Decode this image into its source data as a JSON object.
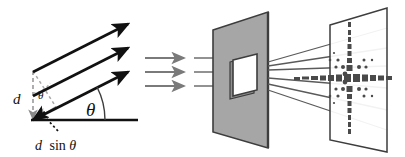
{
  "figure": {
    "background_color": "#ffffff"
  },
  "labels": {
    "d": "d",
    "theta_large": "θ",
    "theta_small": "θ",
    "path_difference": "d sinθ",
    "path_difference_parts": {
      "d": "d",
      "sin": "sin",
      "theta": "θ"
    }
  },
  "colors": {
    "ray_black": "#111111",
    "ray_gray": "#7a7a7a",
    "plate_fill": "#a6a6a6",
    "plate_stroke": "#3d3d3d",
    "aperture_fill": "#ffffff",
    "aperture_stroke": "#3d3d3d",
    "screen_fill": "#ffffff",
    "screen_stroke": "#3d3d3d",
    "pattern_dot": "#4a4a4a",
    "dashed_gray": "#9a9a9a",
    "baseline": "#111111"
  },
  "left_panel": {
    "name": "path-difference-construction",
    "outgoing_rays": [
      {
        "id": "ray-top",
        "x1": 33,
        "y1": 72,
        "x2": 131,
        "y2": 22
      },
      {
        "id": "ray-middle",
        "x1": 33,
        "y1": 96,
        "x2": 131,
        "y2": 46
      },
      {
        "id": "ray-bottom",
        "x1": 33,
        "y1": 120,
        "x2": 131,
        "y2": 70
      }
    ],
    "baseline": {
      "x1": 32,
      "y1": 120,
      "x2": 138,
      "y2": 120
    },
    "spacing_line": {
      "x1": 33,
      "y1": 72,
      "x2": 33,
      "y2": 120,
      "style": "dashed"
    },
    "perpendicular_line": {
      "x1": 33,
      "y1": 72,
      "x2": 55,
      "y2": 106,
      "style": "dashed"
    },
    "path_difference_arrow": {
      "x1": 55,
      "y1": 106,
      "x2": 33,
      "y2": 120
    },
    "angle_arc_large": {
      "cx": 33,
      "cy": 120,
      "r": 72,
      "from_deg": 0,
      "to_deg": 27
    },
    "angle_arc_small": {
      "cx": 33,
      "cy": 72,
      "r": 22,
      "from_deg": 300,
      "to_deg": 330
    },
    "leader_line": {
      "x1": 58,
      "y1": 128,
      "x2": 44,
      "y2": 114,
      "style": "dotted"
    },
    "label_positions": {
      "d": {
        "x": 14,
        "y": 103
      },
      "theta_big": {
        "x": 88,
        "y": 114
      },
      "theta_sm": {
        "x": 38,
        "y": 98
      },
      "d_sin": {
        "x": 36,
        "y": 148
      }
    }
  },
  "middle_panel": {
    "name": "incident-plane-waves",
    "arrows": [
      {
        "id": "incident-arrow-1",
        "x1": 145,
        "y1": 58,
        "x2": 186,
        "y2": 58
      },
      {
        "id": "incident-arrow-2",
        "x1": 145,
        "y1": 72,
        "x2": 186,
        "y2": 72
      },
      {
        "id": "incident-arrow-3",
        "x1": 145,
        "y1": 86,
        "x2": 186,
        "y2": 86
      }
    ],
    "continuation_lines": [
      {
        "id": "incident-line-1",
        "x1": 193,
        "y1": 58,
        "x2": 232,
        "y2": 58
      },
      {
        "id": "incident-line-2",
        "x1": 193,
        "y1": 72,
        "x2": 232,
        "y2": 72
      },
      {
        "id": "incident-line-3",
        "x1": 193,
        "y1": 86,
        "x2": 232,
        "y2": 86
      }
    ]
  },
  "slit_panel": {
    "name": "slit-plate",
    "plate_outline": "213,30 268,12 268,148 213,132",
    "aperture_outline": "233,60 257,54 257,90 233,95",
    "aperture_shadow": "230,62 254,56 254,92 230,97"
  },
  "right_panel": {
    "name": "observation-screen",
    "screen_outline": "330,25 387,8 387,152 330,140",
    "diverging_rays": [
      {
        "id": "diffracted-ray-1",
        "x1": 268,
        "y1": 62,
        "x2": 387,
        "y2": 28
      },
      {
        "id": "diffracted-ray-2",
        "x1": 268,
        "y1": 66,
        "x2": 387,
        "y2": 48
      },
      {
        "id": "diffracted-ray-3",
        "x1": 268,
        "y1": 70,
        "x2": 387,
        "y2": 68
      },
      {
        "id": "diffracted-ray-4",
        "x1": 268,
        "y1": 76,
        "x2": 387,
        "y2": 88
      },
      {
        "id": "diffracted-ray-5",
        "x1": 268,
        "y1": 82,
        "x2": 387,
        "y2": 108
      },
      {
        "id": "diffracted-ray-6",
        "x1": 268,
        "y1": 88,
        "x2": 387,
        "y2": 128
      }
    ],
    "pattern": {
      "center_x": 352,
      "center_y": 78,
      "horizontal_dashes": [
        {
          "dx": -48,
          "w": 7,
          "h": 3
        },
        {
          "dx": -40,
          "w": 7,
          "h": 3
        },
        {
          "dx": -32,
          "w": 6,
          "h": 4
        },
        {
          "dx": -25,
          "w": 6,
          "h": 5
        },
        {
          "dx": -18,
          "w": 6,
          "h": 6
        },
        {
          "dx": -11,
          "w": 6,
          "h": 7
        },
        {
          "dx": -4,
          "w": 6,
          "h": 8
        },
        {
          "dx": 3,
          "w": 6,
          "h": 8
        },
        {
          "dx": 10,
          "w": 6,
          "h": 7
        },
        {
          "dx": 17,
          "w": 6,
          "h": 7
        },
        {
          "dx": 24,
          "w": 6,
          "h": 6
        },
        {
          "dx": 31,
          "w": 5,
          "h": 5
        }
      ],
      "vertical_dots": [
        {
          "dy": -56,
          "w": 3,
          "h": 5
        },
        {
          "dy": -48,
          "w": 3,
          "h": 5
        },
        {
          "dy": -41,
          "w": 3,
          "h": 5
        },
        {
          "dy": -34,
          "w": 4,
          "h": 5
        },
        {
          "dy": -27,
          "w": 4,
          "h": 5
        },
        {
          "dy": -20,
          "w": 5,
          "h": 5
        },
        {
          "dy": -13,
          "w": 6,
          "h": 6
        },
        {
          "dy": 13,
          "w": 6,
          "h": 6
        },
        {
          "dy": 20,
          "w": 5,
          "h": 5
        },
        {
          "dy": 27,
          "w": 4,
          "h": 5
        },
        {
          "dy": 34,
          "w": 4,
          "h": 5
        },
        {
          "dy": 41,
          "w": 3,
          "h": 5
        },
        {
          "dy": 48,
          "w": 3,
          "h": 5
        },
        {
          "dy": 55,
          "w": 3,
          "h": 5
        }
      ],
      "satellite_dots": [
        {
          "dx": -16,
          "dy": -11,
          "r": 1.6
        },
        {
          "dx": -9,
          "dy": -11,
          "r": 2.0
        },
        {
          "dx": 8,
          "dy": -11,
          "r": 2.0
        },
        {
          "dx": 15,
          "dy": -11,
          "r": 1.6
        },
        {
          "dx": -16,
          "dy": 11,
          "r": 1.6
        },
        {
          "dx": -9,
          "dy": 11,
          "r": 2.0
        },
        {
          "dx": 8,
          "dy": 11,
          "r": 2.0
        },
        {
          "dx": 15,
          "dy": 11,
          "r": 1.6
        },
        {
          "dx": -22,
          "dy": -18,
          "r": 1.3
        },
        {
          "dx": -14,
          "dy": -18,
          "r": 1.6
        },
        {
          "dx": 13,
          "dy": -18,
          "r": 1.5
        },
        {
          "dx": 21,
          "dy": -18,
          "r": 1.2
        },
        {
          "dx": -22,
          "dy": 18,
          "r": 1.3
        },
        {
          "dx": -14,
          "dy": 18,
          "r": 1.6
        },
        {
          "dx": 13,
          "dy": 18,
          "r": 1.5
        },
        {
          "dx": 21,
          "dy": 18,
          "r": 1.2
        },
        {
          "dx": -18,
          "dy": -25,
          "r": 1.1
        },
        {
          "dx": -18,
          "dy": 25,
          "r": 1.1
        },
        {
          "dx": -7,
          "dy": -4,
          "r": 2.4
        },
        {
          "dx": -7,
          "dy": 4,
          "r": 2.4
        }
      ]
    }
  }
}
